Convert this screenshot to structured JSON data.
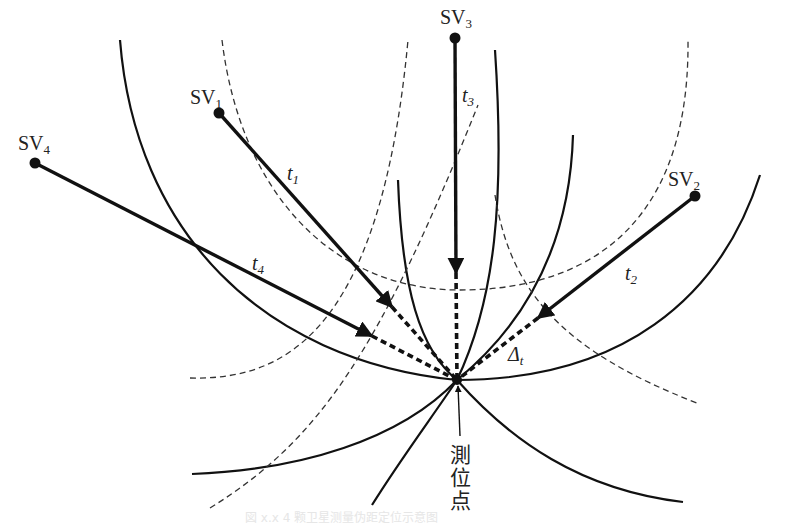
{
  "figure": {
    "type": "gnss-positioning-diagram",
    "receiver": {
      "label_chars": [
        "測",
        "位",
        "点"
      ],
      "x": 457,
      "y": 380
    },
    "satellites": [
      {
        "id": "SV1",
        "label": "SV",
        "sub": "1",
        "x": 219,
        "y": 113,
        "range_label": "t",
        "range_sub": "1",
        "arrow_tip": [
          392,
          307
        ]
      },
      {
        "id": "SV2",
        "label": "SV",
        "sub": "2",
        "x": 695,
        "y": 196,
        "range_label": "t",
        "range_sub": "2",
        "arrow_tip": [
          538,
          318
        ]
      },
      {
        "id": "SV3",
        "label": "SV",
        "sub": "3",
        "x": 455,
        "y": 38,
        "range_label": "t",
        "range_sub": "3",
        "arrow_tip": [
          456,
          273
        ]
      },
      {
        "id": "SV4",
        "label": "SV",
        "sub": "4",
        "x": 35,
        "y": 163,
        "range_label": "t",
        "range_sub": "4",
        "arrow_tip": [
          372,
          336
        ]
      }
    ],
    "clock_bias_label": {
      "symbol": "Δ",
      "sub": "t"
    },
    "caption": "図 x.x 4 颗卫星测量伪距定位示意图",
    "colors": {
      "ink": "#111111",
      "dashed": "#333333",
      "background": "#ffffff",
      "caption": "#e6e6e6"
    }
  }
}
